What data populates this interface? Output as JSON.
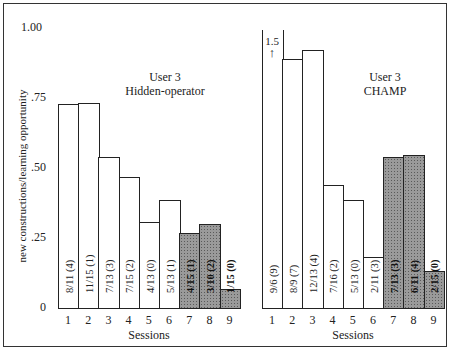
{
  "chart_data": [
    {
      "type": "bar",
      "title": "User 3 Hidden-operator",
      "title_lines": [
        "User 3",
        "Hidden-operator"
      ],
      "xlabel": "Sessions",
      "ylabel": "new constructions/learning opportunity",
      "ylim": [
        0,
        1.0
      ],
      "yticks": [
        "0",
        ".25",
        ".50",
        ".75",
        "1.00"
      ],
      "categories": [
        "1",
        "2",
        "3",
        "4",
        "5",
        "6",
        "7",
        "8",
        "9"
      ],
      "values": [
        0.727,
        0.733,
        0.538,
        0.467,
        0.308,
        0.385,
        0.267,
        0.3,
        0.067
      ],
      "bar_labels": [
        "8/11 (4)",
        "11/15 (1)",
        "7/13 (3)",
        "7/15 (2)",
        "4/13 (0)",
        "5/13 (1)",
        "4/15 (1)",
        "3/10 (2)",
        "1/15 (0)"
      ],
      "shaded": [
        false,
        false,
        false,
        false,
        false,
        false,
        true,
        true,
        true
      ]
    },
    {
      "type": "bar",
      "title": "User 3 CHAMP",
      "title_lines": [
        "User 3",
        "CHAMP"
      ],
      "xlabel": "Sessions",
      "ylabel": "new constructions/learning opportunity",
      "ylim": [
        0,
        1.0
      ],
      "categories": [
        "1",
        "2",
        "3",
        "4",
        "5",
        "6",
        "7",
        "8",
        "9"
      ],
      "values": [
        1.5,
        0.889,
        0.923,
        0.438,
        0.385,
        0.182,
        0.538,
        0.545,
        0.133
      ],
      "bar_labels": [
        "9/6 (9)",
        "8/9 (7)",
        "12/13 (4)",
        "7/16 (2)",
        "5/13 (0)",
        "2/11 (3)",
        "7/13 (3)",
        "6/11 (4)",
        "2/15 (0)"
      ],
      "shaded": [
        false,
        false,
        false,
        false,
        false,
        false,
        true,
        true,
        true
      ],
      "annotations": [
        {
          "bar": 1,
          "text": "1.5",
          "arrow": "up"
        }
      ]
    }
  ]
}
